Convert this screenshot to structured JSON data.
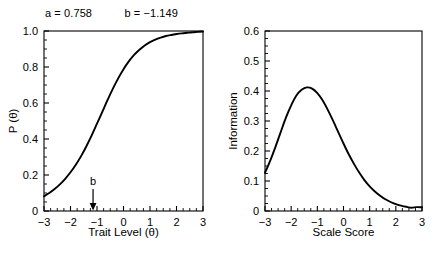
{
  "figure": {
    "header": {
      "a_label": "a = 0.758",
      "b_label": "b = −1.149"
    }
  },
  "chart_data": [
    {
      "type": "line",
      "id": "item-characteristic-curve",
      "title": "",
      "xlabel": "Trait Level (θ)",
      "ylabel": "P (θ)",
      "xlim": [
        -3,
        3
      ],
      "ylim": [
        0,
        1.0
      ],
      "xticks": [
        -3,
        -2,
        -1,
        0,
        1,
        2,
        3
      ],
      "xticklabels": [
        "−3",
        "−2",
        "−1",
        "0",
        "1",
        "2",
        "3"
      ],
      "yticks": [
        0,
        0.2,
        0.4,
        0.6,
        0.8,
        1.0
      ],
      "yticklabels": [
        "0",
        "0.2",
        "0.4",
        "0.6",
        "0.8",
        "1.0"
      ],
      "minor_x_step": 0.25,
      "minor_y_step": 0.05,
      "grid": false,
      "legend": "none",
      "annotations": [
        {
          "label": "b",
          "x": -1.149,
          "y": 0,
          "marker": "down-arrow"
        }
      ],
      "x": [
        -3.0,
        -2.8,
        -2.6,
        -2.4,
        -2.2,
        -2.0,
        -1.8,
        -1.6,
        -1.4,
        -1.2,
        -1.0,
        -0.8,
        -0.6,
        -0.4,
        -0.2,
        0.0,
        0.2,
        0.4,
        0.6,
        0.8,
        1.0,
        1.2,
        1.4,
        1.6,
        1.8,
        2.0,
        2.2,
        2.4,
        2.6,
        2.8,
        3.0
      ],
      "y": [
        0.082,
        0.1,
        0.122,
        0.148,
        0.179,
        0.215,
        0.257,
        0.305,
        0.36,
        0.42,
        0.485,
        0.551,
        0.617,
        0.68,
        0.737,
        0.788,
        0.831,
        0.867,
        0.896,
        0.92,
        0.938,
        0.952,
        0.963,
        0.972,
        0.978,
        0.983,
        0.987,
        0.99,
        0.993,
        0.995,
        0.997
      ]
    },
    {
      "type": "line",
      "id": "item-information-function",
      "title": "",
      "xlabel": "Scale Score",
      "ylabel": "Information",
      "xlim": [
        -3,
        3
      ],
      "ylim": [
        0,
        0.6
      ],
      "xticks": [
        -3,
        -2,
        -1,
        0,
        1,
        2,
        3
      ],
      "xticklabels": [
        "−3",
        "−2",
        "−1",
        "0",
        "1",
        "2",
        "3"
      ],
      "yticks": [
        0,
        0.1,
        0.2,
        0.3,
        0.4,
        0.5,
        0.6
      ],
      "yticklabels": [
        "0",
        "0.1",
        "0.2",
        "0.3",
        "0.4",
        "0.5",
        "0.6"
      ],
      "minor_x_step": 0.25,
      "minor_y_step": 0.025,
      "grid": false,
      "legend": "none",
      "peak": {
        "x": -1.149,
        "y": 0.41
      },
      "x": [
        -3.0,
        -2.8,
        -2.6,
        -2.4,
        -2.2,
        -2.0,
        -1.8,
        -1.6,
        -1.4,
        -1.2,
        -1.0,
        -0.8,
        -0.6,
        -0.4,
        -0.2,
        0.0,
        0.2,
        0.4,
        0.6,
        0.8,
        1.0,
        1.2,
        1.4,
        1.6,
        1.8,
        2.0,
        2.2,
        2.4,
        2.6,
        2.8,
        3.0
      ],
      "y": [
        0.127,
        0.168,
        0.214,
        0.263,
        0.311,
        0.352,
        0.385,
        0.404,
        0.412,
        0.408,
        0.393,
        0.369,
        0.337,
        0.301,
        0.263,
        0.225,
        0.189,
        0.157,
        0.128,
        0.103,
        0.082,
        0.065,
        0.051,
        0.039,
        0.03,
        0.023,
        0.018,
        0.014,
        0.011,
        0.013,
        0.012
      ]
    }
  ]
}
